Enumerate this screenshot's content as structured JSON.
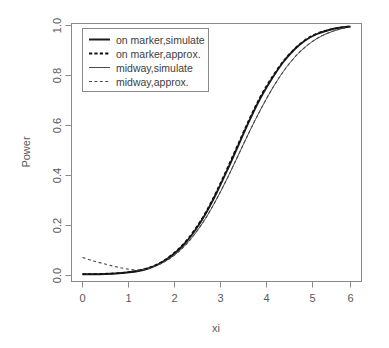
{
  "chart_data": {
    "type": "line",
    "title": "",
    "subtitle": "",
    "xlabel": "xi",
    "ylabel": "Power",
    "xlim": [
      0,
      6
    ],
    "ylim": [
      0,
      1
    ],
    "xticks": [
      "0",
      "1",
      "2",
      "3",
      "4",
      "5",
      "6"
    ],
    "yticks": [
      "0.0",
      "0.2",
      "0.4",
      "0.6",
      "0.8",
      "1.0"
    ],
    "grid": false,
    "legend_position": "top-left",
    "x": [
      0,
      0.25,
      0.5,
      0.75,
      1,
      1.25,
      1.5,
      1.75,
      2,
      2.25,
      2.5,
      2.75,
      3,
      3.25,
      3.5,
      3.75,
      4,
      4.25,
      4.5,
      4.75,
      5,
      5.25,
      5.5,
      5.75,
      6
    ],
    "series": [
      {
        "name": "on marker,simulate",
        "style": "solid",
        "weight": "thick",
        "color": "#1c1c1c",
        "values": [
          0.005,
          0.005,
          0.006,
          0.008,
          0.012,
          0.018,
          0.03,
          0.05,
          0.08,
          0.12,
          0.175,
          0.245,
          0.33,
          0.425,
          0.525,
          0.625,
          0.715,
          0.79,
          0.855,
          0.905,
          0.942,
          0.966,
          0.981,
          0.991,
          0.996
        ]
      },
      {
        "name": "on marker,approx.",
        "style": "dashed",
        "weight": "thick",
        "color": "#111111",
        "values": [
          0.006,
          0.006,
          0.007,
          0.009,
          0.013,
          0.02,
          0.032,
          0.052,
          0.083,
          0.124,
          0.18,
          0.25,
          0.336,
          0.432,
          0.532,
          0.631,
          0.721,
          0.795,
          0.858,
          0.907,
          0.944,
          0.968,
          0.982,
          0.991,
          0.996
        ]
      },
      {
        "name": "midway,simulate",
        "style": "solid",
        "weight": "thin",
        "color": "#4a4a4a",
        "values": [
          0.005,
          0.005,
          0.006,
          0.008,
          0.012,
          0.018,
          0.029,
          0.047,
          0.074,
          0.112,
          0.163,
          0.227,
          0.305,
          0.392,
          0.486,
          0.58,
          0.668,
          0.748,
          0.817,
          0.873,
          0.916,
          0.948,
          0.97,
          0.985,
          0.995
        ]
      },
      {
        "name": "midway,approx.",
        "style": "dashed",
        "weight": "thin",
        "color": "#4a4a4a",
        "values": [
          0.072,
          0.058,
          0.046,
          0.035,
          0.026,
          0.022,
          0.029,
          0.047,
          0.074,
          0.112,
          0.163,
          0.227,
          0.305,
          0.392,
          0.486,
          0.58,
          0.668,
          0.748,
          0.817,
          0.873,
          0.916,
          0.948,
          0.97,
          0.985,
          0.995
        ]
      }
    ],
    "legend_entries": [
      "on marker,simulate",
      "on marker,approx.",
      "midway,simulate",
      "midway,approx."
    ]
  }
}
